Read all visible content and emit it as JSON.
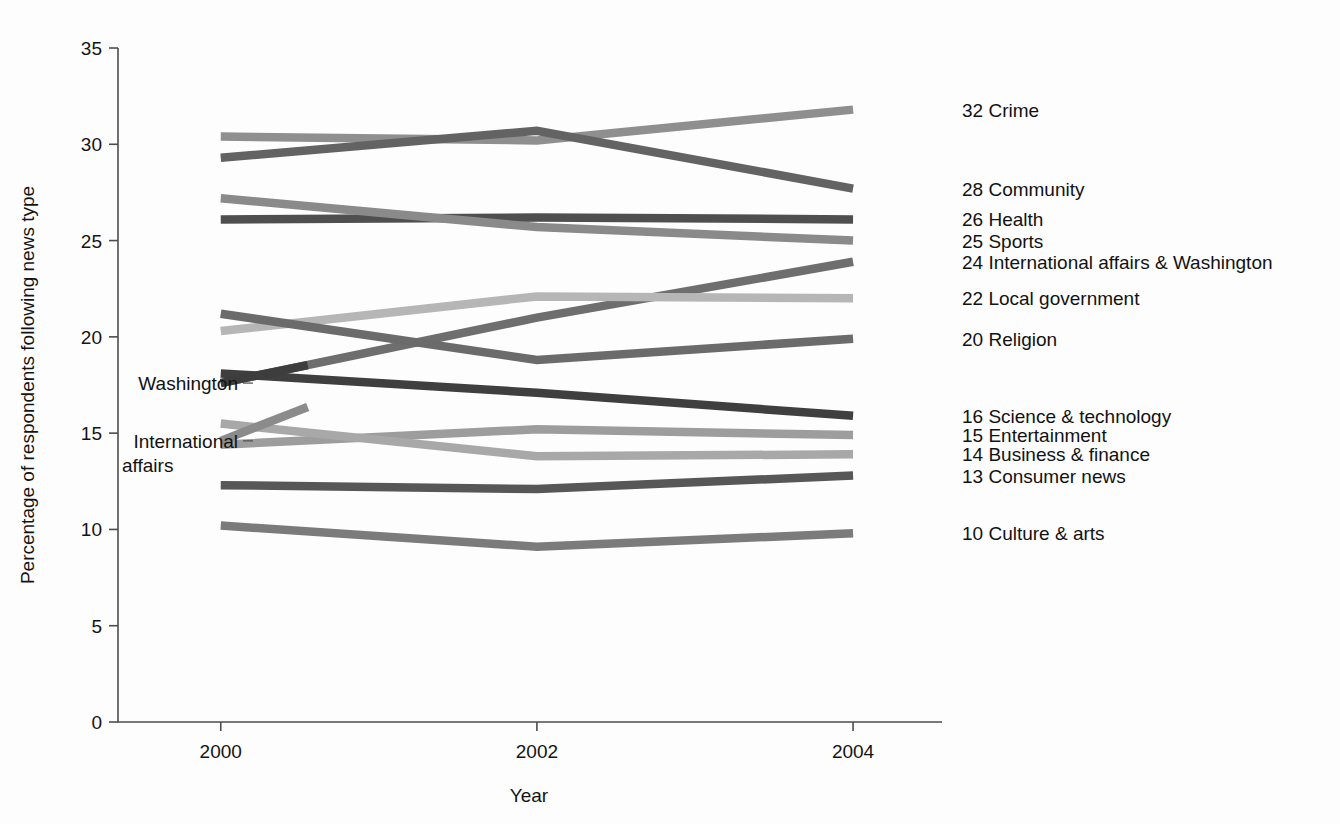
{
  "chart_data": {
    "type": "line",
    "title": "",
    "xlabel": "Year",
    "ylabel": "Percentage of respondents following news type",
    "x": [
      2000,
      2002,
      2004
    ],
    "xticklabels": [
      "2000",
      "2002",
      "2004"
    ],
    "yticklabels": [
      "0",
      "5",
      "10",
      "15",
      "20",
      "25",
      "30",
      "35"
    ],
    "yticks": [
      0,
      5,
      10,
      15,
      20,
      25,
      30,
      35
    ],
    "ylim": [
      0,
      35
    ],
    "xlim": [
      1999.35,
      2004.55
    ],
    "grid": false,
    "legend_position": "right-inline-end-labels",
    "series": [
      {
        "name": "Crime",
        "end_value": "32",
        "label": "Crime",
        "values": [
          30.4,
          30.2,
          31.8
        ],
        "color": "#8f8f8f"
      },
      {
        "name": "Community",
        "end_value": "28",
        "label": "Community",
        "values": [
          29.3,
          30.7,
          27.7
        ],
        "color": "#636363"
      },
      {
        "name": "Health",
        "end_value": "26",
        "label": "Health",
        "values": [
          26.1,
          26.2,
          26.1
        ],
        "color": "#4f4f4f"
      },
      {
        "name": "Sports",
        "end_value": "25",
        "label": "Sports",
        "values": [
          27.2,
          25.7,
          25.0
        ],
        "color": "#8a8a8a"
      },
      {
        "name": "International affairs & Washington",
        "end_value": "24",
        "label": "International affairs & Washington",
        "values": [
          17.6,
          21.0,
          23.9
        ],
        "color": "#6e6e6e"
      },
      {
        "name": "Local government",
        "end_value": "22",
        "label": "Local government",
        "values": [
          20.3,
          22.1,
          22.0
        ],
        "color": "#b6b6b6"
      },
      {
        "name": "Religion",
        "end_value": "20",
        "label": "Religion",
        "values": [
          21.2,
          18.8,
          19.9
        ],
        "color": "#6b6b6b"
      },
      {
        "name": "Science & technology",
        "end_value": "16",
        "label": "Science & technology",
        "values": [
          18.1,
          17.1,
          15.9
        ],
        "color": "#3f3f3f"
      },
      {
        "name": "Entertainment",
        "end_value": "15",
        "label": "Entertainment",
        "values": [
          14.4,
          15.2,
          14.9
        ],
        "color": "#9d9d9d"
      },
      {
        "name": "Business & finance",
        "end_value": "14",
        "label": "Business & finance",
        "values": [
          15.5,
          13.8,
          13.9
        ],
        "color": "#a8a8a8"
      },
      {
        "name": "Consumer news",
        "end_value": "13",
        "label": "Consumer news",
        "values": [
          12.3,
          12.1,
          12.8
        ],
        "color": "#575757"
      },
      {
        "name": "Culture & arts",
        "end_value": "10",
        "label": "Culture & arts",
        "values": [
          10.2,
          9.1,
          9.8
        ],
        "color": "#7b7b7b"
      }
    ],
    "annotations": [
      {
        "name": "washington",
        "text": "Washington",
        "line2": "",
        "value_2000": 17.6
      },
      {
        "name": "international-affairs",
        "text": "International",
        "line2": "affairs",
        "value_2000": 14.6
      }
    ],
    "annotation_series": [
      {
        "name": "Washington",
        "values": [
          17.6,
          21.0,
          23.9
        ],
        "color": "#3d3d3d",
        "partial_to": 2000.55
      },
      {
        "name": "International affairs",
        "values": [
          14.6,
          21.0,
          23.9
        ],
        "color": "#8b8b8b",
        "partial_to": 2000.55
      }
    ]
  },
  "colors": {
    "axis": "#4d4d4d",
    "text": "#121212",
    "background": "#fdfdfd"
  }
}
